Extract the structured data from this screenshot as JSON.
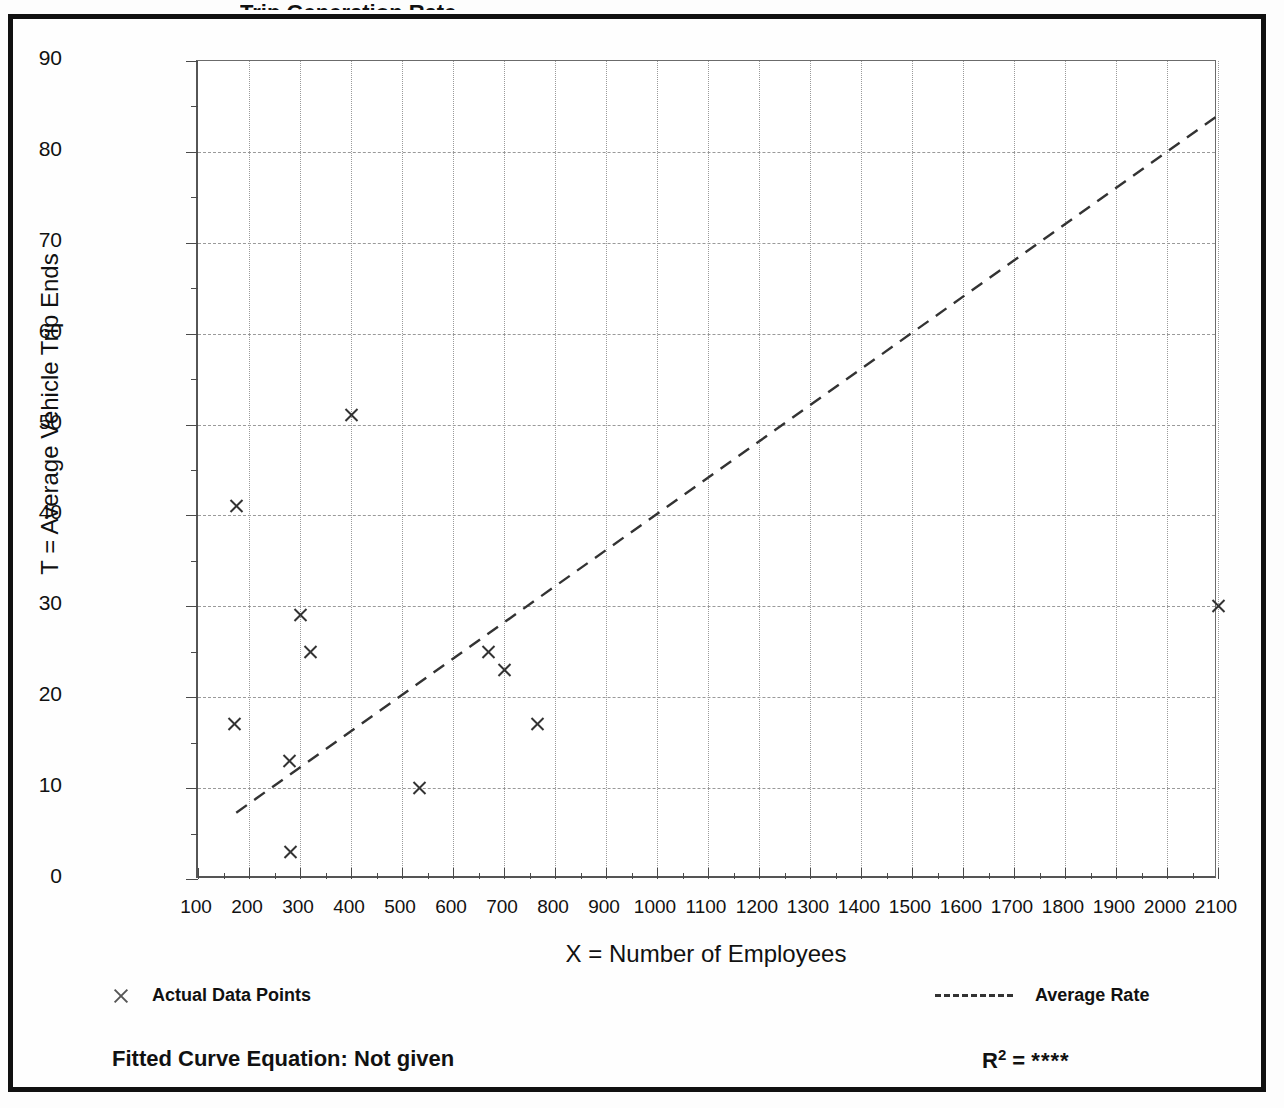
{
  "figure": {
    "title_sliver": "Trip Generation Rate",
    "equation_label": "Fitted Curve Equation:  Not given",
    "r2_label": "R",
    "r2_exponent": "2",
    "r2_equals": "=",
    "r2_value": "****"
  },
  "legend": {
    "points_label": "Actual Data Points",
    "line_label": "Average Rate",
    "points_marker": "x-marker-icon",
    "line_marker": "dashed-line-icon"
  },
  "chart_data": {
    "type": "scatter",
    "title": "",
    "xlabel": "X = Number of Employees",
    "ylabel": "T = Average Vehicle Trip Ends",
    "xlim": [
      100,
      2100
    ],
    "ylim": [
      0,
      90
    ],
    "xticks": [
      100,
      200,
      300,
      400,
      500,
      600,
      700,
      800,
      900,
      1000,
      1100,
      1200,
      1300,
      1400,
      1500,
      1600,
      1700,
      1800,
      1900,
      2000,
      2100
    ],
    "xtick_labels": [
      "100",
      "200",
      "300",
      "400",
      "500",
      "600",
      "700",
      "800",
      "900",
      "1000",
      "1100",
      "1200",
      "1300",
      "1400",
      "1500",
      "1600",
      "1700",
      "1800",
      "1900",
      "2000",
      "2100"
    ],
    "xminor_step": 50,
    "yticks": [
      0,
      10,
      20,
      30,
      40,
      50,
      60,
      70,
      80,
      90
    ],
    "ytick_labels": [
      "0",
      "10",
      "20",
      "30",
      "40",
      "50",
      "60",
      "70",
      "80",
      "90"
    ],
    "yminor_step": 5,
    "grid": true,
    "legend_position": "below-axes",
    "series": [
      {
        "name": "Actual Data Points",
        "type": "scatter",
        "marker": "x",
        "color": "#333333",
        "points": [
          {
            "x": 175,
            "y": 41
          },
          {
            "x": 172,
            "y": 17
          },
          {
            "x": 280,
            "y": 13
          },
          {
            "x": 282,
            "y": 3
          },
          {
            "x": 300,
            "y": 29
          },
          {
            "x": 320,
            "y": 25
          },
          {
            "x": 400,
            "y": 51
          },
          {
            "x": 535,
            "y": 10
          },
          {
            "x": 670,
            "y": 25
          },
          {
            "x": 700,
            "y": 23
          },
          {
            "x": 765,
            "y": 17
          },
          {
            "x": 2100,
            "y": 30
          }
        ]
      },
      {
        "name": "Average Rate",
        "type": "line",
        "style": "dashed",
        "color": "#333333",
        "x": [
          175,
          2100
        ],
        "y": [
          7.3,
          84
        ]
      }
    ]
  }
}
